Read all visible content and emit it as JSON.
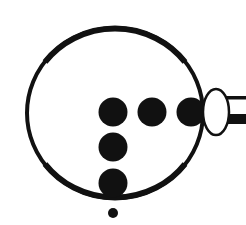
{
  "diagram": {
    "title": "",
    "colors": {
      "ink": "#111111",
      "background": "#ffffff"
    },
    "ring": {
      "cx": 115,
      "cy": 113,
      "r": 87
    },
    "dots": [
      {
        "name": "dot-center",
        "cx": 113,
        "cy": 112,
        "r": 14.5
      },
      {
        "name": "dot-right-1",
        "cx": 152,
        "cy": 112,
        "r": 14.5
      },
      {
        "name": "dot-right-2",
        "cx": 191,
        "cy": 112,
        "r": 14.5
      },
      {
        "name": "dot-down-1",
        "cx": 113,
        "cy": 147,
        "r": 14.5
      },
      {
        "name": "dot-down-2",
        "cx": 113,
        "cy": 183,
        "r": 14.5
      }
    ],
    "small_dot": {
      "cx": 113,
      "cy": 213,
      "r": 5
    },
    "ellipse": {
      "cx": 216,
      "cy": 112,
      "rx": 13,
      "ry": 23
    },
    "connector": {
      "x": 228,
      "thin_y": 96,
      "thin_h": 3,
      "thick_y": 114,
      "thick_h": 10
    }
  }
}
